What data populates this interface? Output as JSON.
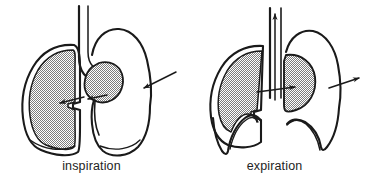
{
  "figure": {
    "background_color": "#ffffff",
    "line_color": "#1a1a1a",
    "shading_color": "#d9d9d9",
    "label_color": "#232323"
  },
  "panels": [
    {
      "id": "inspiration",
      "caption": "inspiration",
      "lung_state": "expanded",
      "diaphragm_state": "flattened",
      "airflow_direction": "in",
      "icons": {
        "lung": "shaded-lung-icon",
        "heart": "heart-icon",
        "trachea": "trachea-icon",
        "diaphragm": "diaphragm-icon",
        "inward_arrow": "inward-arrow-icon",
        "chest_wall_arrow": "chest-wall-inward-arrow-icon"
      }
    },
    {
      "id": "expiration",
      "caption": "expiration",
      "lung_state": "contracted",
      "diaphragm_state": "domed",
      "airflow_direction": "out",
      "icons": {
        "lung": "shaded-lung-icon",
        "heart": "heart-icon",
        "trachea": "trachea-icon",
        "diaphragm": "diaphragm-icon",
        "outward_arrow": "outward-arrow-icon",
        "trachea_up_arrow": "trachea-up-arrow-icon",
        "chest_wall_arrow": "chest-wall-outward-arrow-icon"
      }
    }
  ]
}
